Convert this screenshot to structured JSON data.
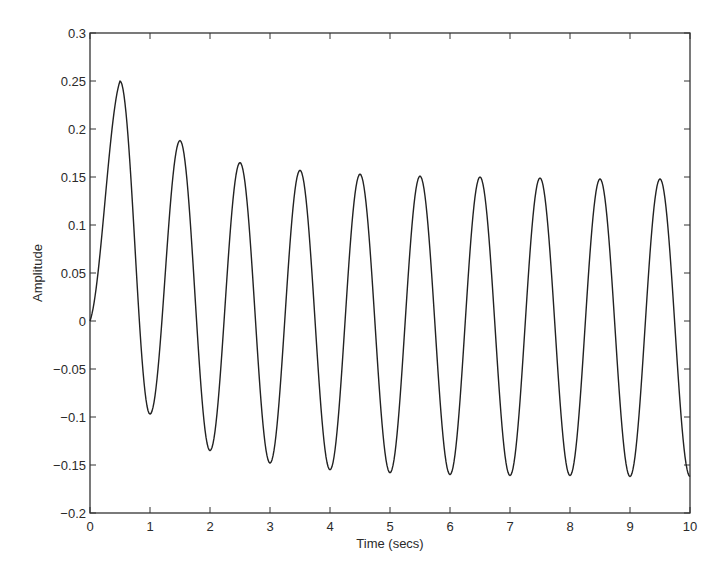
{
  "chart_data": {
    "type": "line",
    "title": "",
    "xlabel": "Time (secs)",
    "ylabel": "Amplitude",
    "xlim": [
      0,
      10
    ],
    "ylim": [
      -0.2,
      0.3
    ],
    "grid": false,
    "legend": null,
    "xticks": [
      0,
      1,
      2,
      3,
      4,
      5,
      6,
      7,
      8,
      9,
      10
    ],
    "xtick_labels": [
      "0",
      "1",
      "2",
      "3",
      "4",
      "5",
      "6",
      "7",
      "8",
      "9",
      "10"
    ],
    "yticks": [
      -0.2,
      -0.15,
      -0.1,
      -0.05,
      0,
      0.05,
      0.1,
      0.15,
      0.2,
      0.25,
      0.3
    ],
    "ytick_labels": [
      "-0.2",
      "-0.15",
      "-0.1",
      "-0.05",
      "0",
      "0.05",
      "0.1",
      "0.15",
      "0.2",
      "0.25",
      "0.3"
    ],
    "series": [
      {
        "name": "response",
        "color": "#222222",
        "extrema": {
          "x": [
            0,
            0.5,
            1.0,
            1.5,
            2.0,
            2.5,
            3.0,
            3.5,
            4.0,
            4.5,
            5.0,
            5.5,
            6.0,
            6.5,
            7.0,
            7.5,
            8.0,
            8.5,
            9.0,
            9.5,
            10.0
          ],
          "y": [
            0,
            0.25,
            -0.097,
            0.188,
            -0.135,
            0.165,
            -0.148,
            0.157,
            -0.155,
            0.153,
            -0.158,
            0.151,
            -0.16,
            0.15,
            -0.161,
            0.149,
            -0.161,
            0.148,
            -0.162,
            0.148,
            -0.162
          ]
        }
      }
    ]
  }
}
